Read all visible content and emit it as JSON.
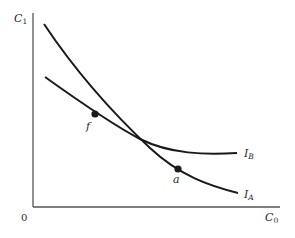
{
  "figure": {
    "type": "indifference-curves",
    "y_axis_label": "C",
    "y_axis_sub": "1",
    "x_axis_label": "C",
    "x_axis_sub": "0",
    "origin_label": "0",
    "curves": [
      {
        "name": "I",
        "sub": "A"
      },
      {
        "name": "I",
        "sub": "B"
      }
    ],
    "points": [
      {
        "label": "f",
        "on_curve": "I_B"
      },
      {
        "label": "a",
        "on_curve": "I_A"
      }
    ],
    "colors": {
      "line": "#1a1a1a",
      "axis": "#555555",
      "text": "#2a2a2a"
    }
  }
}
